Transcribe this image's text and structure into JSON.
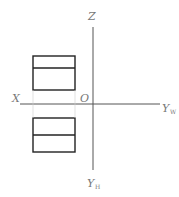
{
  "diagram": {
    "type": "orthographic-projection-axes",
    "labels": {
      "z": "Z",
      "x": "X",
      "origin": "O",
      "y_w_main": "Y",
      "y_w_sub": "W",
      "y_h_main": "Y",
      "y_h_sub": "H"
    },
    "colors": {
      "axis": "#555555",
      "object": "#222222",
      "label": "#777777",
      "background": "#ffffff"
    },
    "views": [
      {
        "name": "front-view",
        "position": "above X axis",
        "divisions": 2
      },
      {
        "name": "top-view",
        "position": "below X axis",
        "divisions": 2
      }
    ]
  }
}
